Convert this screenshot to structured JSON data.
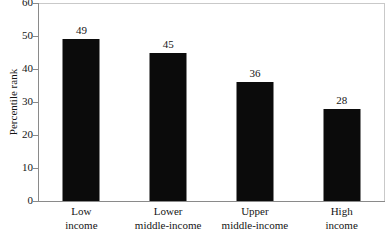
{
  "chart_data": {
    "type": "bar",
    "title": "",
    "xlabel": "",
    "ylabel": "Percentile rank",
    "ylim": [
      0,
      60
    ],
    "ytick_labels": [
      "60",
      "50",
      "40",
      "30",
      "20",
      "10",
      "0"
    ],
    "ytick_values": [
      60,
      50,
      40,
      30,
      20,
      10,
      0
    ],
    "grid": false,
    "legend": null,
    "bar_color": "#0b0b0b",
    "axis_color": "#8a8a8a",
    "frame_color": "#c9c9c9",
    "text_color": "#151515",
    "categories": [
      "Low income",
      "Lower middle-income",
      "Upper middle-income",
      "High income"
    ],
    "category_lines": [
      {
        "line1": "Low",
        "line2": "income"
      },
      {
        "line1": "Lower",
        "line2": "middle-income"
      },
      {
        "line1": "Upper",
        "line2": "middle-income"
      },
      {
        "line1": "High",
        "line2": "income"
      }
    ],
    "values": [
      49,
      45,
      36,
      28
    ],
    "value_labels": [
      "49",
      "45",
      "36",
      "28"
    ]
  }
}
